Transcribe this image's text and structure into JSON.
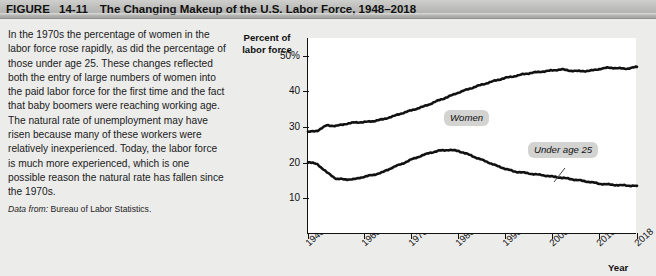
{
  "header": {
    "figure_label": "FIGURE",
    "figure_number": "14-11",
    "title": "The Changing Makeup of the U.S. Labor Force, 1948–2018"
  },
  "caption": {
    "body": "In the 1970s the percentage of women in the labor force rose rapidly, as did the percentage of those under age 25. These changes reflected both the entry of large numbers of women into the paid labor force for the first time and the fact that baby boomers were reaching working age. The natural rate of unemployment may have risen because many of these workers were relatively inexperienced. Today, the labor force is much more experienced, which is one possible reason the natural rate has fallen since the 1970s.",
    "source_prefix": "Data from:",
    "source_text": "Bureau of Labor Statistics."
  },
  "chart_data": {
    "type": "line",
    "title": "The Changing Makeup of the U.S. Labor Force, 1948–2018",
    "ylabel": "Percent of labor force",
    "xlabel": "Year",
    "ylim": [
      0,
      55
    ],
    "xlim": [
      1948,
      2018
    ],
    "ytick_values": [
      10,
      20,
      30,
      40,
      50
    ],
    "ytick_labels": [
      "10",
      "20",
      "30",
      "40",
      "50%"
    ],
    "xtick_values": [
      1948,
      1960,
      1970,
      1980,
      1990,
      2000,
      2010,
      2018
    ],
    "xtick_labels": [
      "1948",
      "1960",
      "1970",
      "1980",
      "1990",
      "2000",
      "2010",
      "2018"
    ],
    "grid": false,
    "legend_position": "inline-callout",
    "line_color": "#111111",
    "series": [
      {
        "name": "Women",
        "callout_label": "Women",
        "x": [
          1948,
          1950,
          1952,
          1954,
          1956,
          1958,
          1960,
          1962,
          1964,
          1966,
          1968,
          1970,
          1972,
          1974,
          1976,
          1978,
          1980,
          1982,
          1984,
          1986,
          1988,
          1990,
          1992,
          1994,
          1996,
          1998,
          2000,
          2002,
          2004,
          2006,
          2008,
          2010,
          2012,
          2014,
          2016,
          2018
        ],
        "values": [
          28.6,
          29.0,
          30.5,
          30.3,
          30.9,
          31.3,
          31.4,
          31.7,
          32.2,
          33.0,
          33.9,
          34.7,
          35.5,
          36.5,
          37.6,
          38.6,
          39.7,
          40.6,
          41.5,
          42.3,
          43.1,
          43.8,
          44.3,
          44.9,
          45.3,
          45.6,
          45.9,
          46.2,
          45.8,
          45.7,
          45.8,
          46.3,
          46.7,
          46.5,
          46.4,
          46.9
        ],
        "units": "percent of labor force"
      },
      {
        "name": "Under age 25",
        "callout_label": "Under age 25",
        "x": [
          1948,
          1950,
          1952,
          1954,
          1956,
          1958,
          1960,
          1962,
          1964,
          1966,
          1968,
          1970,
          1972,
          1974,
          1976,
          1978,
          1980,
          1982,
          1984,
          1986,
          1988,
          1990,
          1992,
          1994,
          1996,
          1998,
          2000,
          2002,
          2004,
          2006,
          2008,
          2010,
          2012,
          2014,
          2016,
          2018
        ],
        "values": [
          20.2,
          19.6,
          17.3,
          15.5,
          15.3,
          15.4,
          16.1,
          16.6,
          17.4,
          18.7,
          19.7,
          20.9,
          21.9,
          22.8,
          23.4,
          23.6,
          23.3,
          22.4,
          21.3,
          20.3,
          19.2,
          18.3,
          17.5,
          17.2,
          16.8,
          16.5,
          16.1,
          15.8,
          15.4,
          15.0,
          14.6,
          14.1,
          13.9,
          13.7,
          13.6,
          13.5
        ],
        "units": "percent of labor force"
      }
    ]
  }
}
